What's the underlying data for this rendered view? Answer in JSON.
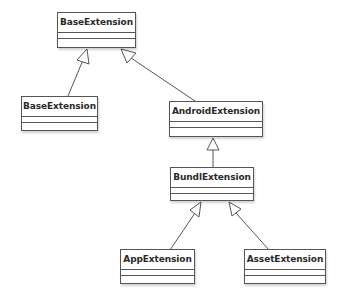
{
  "diagram": {
    "type": "uml-class-inheritance",
    "colors": {
      "border": "#555555",
      "text": "#2a2a2a",
      "background": "#ffffff"
    },
    "classes": [
      {
        "id": "base_top",
        "name": "BaseExtension",
        "x": 57,
        "y": 12,
        "w": 79,
        "h": 36
      },
      {
        "id": "base_left",
        "name": "BaseExtension",
        "x": 21,
        "y": 96,
        "w": 77,
        "h": 35
      },
      {
        "id": "android",
        "name": "AndroidExtension",
        "x": 169,
        "y": 101,
        "w": 94,
        "h": 36
      },
      {
        "id": "bundle",
        "name": "BundlExtension",
        "x": 170,
        "y": 167,
        "w": 84,
        "h": 34
      },
      {
        "id": "app",
        "name": "AppExtension",
        "x": 120,
        "y": 249,
        "w": 75,
        "h": 35
      },
      {
        "id": "asset",
        "name": "AssetExtension",
        "x": 244,
        "y": 249,
        "w": 82,
        "h": 35
      }
    ],
    "relations": [
      {
        "type": "generalization",
        "from": "base_left",
        "to": "base_top"
      },
      {
        "type": "generalization",
        "from": "android",
        "to": "base_top"
      },
      {
        "type": "generalization",
        "from": "bundle",
        "to": "android"
      },
      {
        "type": "generalization",
        "from": "app",
        "to": "bundle"
      },
      {
        "type": "generalization",
        "from": "asset",
        "to": "bundle"
      }
    ]
  }
}
